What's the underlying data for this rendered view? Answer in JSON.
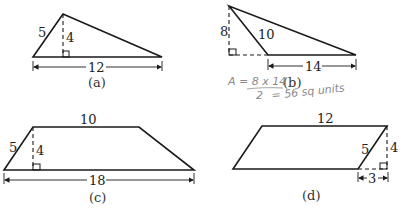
{
  "figures": {
    "a": {
      "caption": "(a)",
      "shape": "triangle",
      "side_label": "5",
      "height_label": "4",
      "base_label": "12"
    },
    "b": {
      "caption": "(b)",
      "shape": "obtuse-triangle",
      "height_label": "8",
      "side_label": "10",
      "base_label": "14",
      "handwriting": {
        "line1": "A = 8 x 14",
        "line2": "2",
        "line3": "= 56 sq units"
      }
    },
    "c": {
      "caption": "(c)",
      "shape": "trapezoid",
      "top_label": "10",
      "side_label": "5",
      "height_label": "4",
      "base_label": "18"
    },
    "d": {
      "caption": "(d)",
      "shape": "parallelogram",
      "top_label": "12",
      "side_label": "5",
      "height_label": "4",
      "offset_label": "3"
    }
  },
  "colors": {
    "line": "#1a1a1a",
    "handwriting": "#8a8a8a",
    "background": "#ffffff"
  }
}
